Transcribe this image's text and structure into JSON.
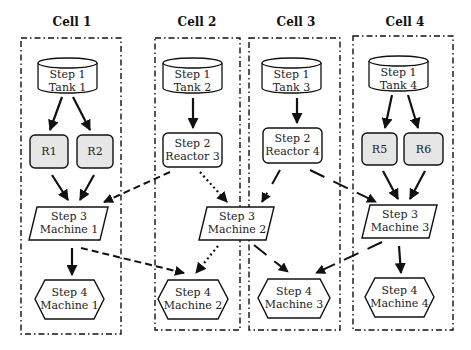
{
  "diagram": {
    "type": "manufacturing cell flow diagram",
    "cells": [
      {
        "id": "cell1",
        "label": "Cell 1"
      },
      {
        "id": "cell2",
        "label": "Cell 2"
      },
      {
        "id": "cell3",
        "label": "Cell 3"
      },
      {
        "id": "cell4",
        "label": "Cell 4"
      }
    ],
    "nodes": {
      "tank1": {
        "line1": "Step 1",
        "line2": "Tank 1",
        "shape": "cylinder"
      },
      "tank2": {
        "line1": "Step 1",
        "line2": "Tank 2",
        "shape": "cylinder"
      },
      "tank3": {
        "line1": "Step 1",
        "line2": "Tank 3",
        "shape": "cylinder"
      },
      "tank4": {
        "line1": "Step 1",
        "line2": "Tank 4",
        "shape": "cylinder"
      },
      "r1": {
        "label": "R1",
        "shape": "rounded-rect-shaded"
      },
      "r2": {
        "label": "R2",
        "shape": "rounded-rect-shaded"
      },
      "r5": {
        "label": "R5",
        "shape": "rounded-rect-shaded"
      },
      "r6": {
        "label": "R6",
        "shape": "rounded-rect-shaded"
      },
      "reactor3": {
        "line1": "Step 2",
        "line2": "Reactor 3",
        "shape": "rounded-rect"
      },
      "reactor4": {
        "line1": "Step 2",
        "line2": "Reactor 4",
        "shape": "rounded-rect"
      },
      "s3m1": {
        "line1": "Step 3",
        "line2": "Machine 1",
        "shape": "parallelogram"
      },
      "s3m2": {
        "line1": "Step 3",
        "line2": "Machine 2",
        "shape": "parallelogram"
      },
      "s3m3": {
        "line1": "Step 3",
        "line2": "Machine 3",
        "shape": "parallelogram"
      },
      "s4m1": {
        "line1": "Step 4",
        "line2": "Machine 1",
        "shape": "hexagon"
      },
      "s4m2": {
        "line1": "Step 4",
        "line2": "Machine 2",
        "shape": "hexagon"
      },
      "s4m3": {
        "line1": "Step 4",
        "line2": "Machine 3",
        "shape": "hexagon"
      },
      "s4m4": {
        "line1": "Step 4",
        "line2": "Machine 4",
        "shape": "hexagon"
      }
    },
    "edges": [
      {
        "from": "tank1",
        "to": "r1",
        "style": "solid"
      },
      {
        "from": "tank1",
        "to": "r2",
        "style": "solid"
      },
      {
        "from": "r1",
        "to": "s3m1",
        "style": "solid"
      },
      {
        "from": "r2",
        "to": "s3m1",
        "style": "solid"
      },
      {
        "from": "s3m1",
        "to": "s4m1",
        "style": "solid"
      },
      {
        "from": "s3m1",
        "to": "s4m2",
        "style": "dashed"
      },
      {
        "from": "tank2",
        "to": "reactor3",
        "style": "solid"
      },
      {
        "from": "reactor3",
        "to": "s3m1",
        "style": "dashed"
      },
      {
        "from": "reactor3",
        "to": "s3m2",
        "style": "dotted"
      },
      {
        "from": "s3m2",
        "to": "s4m2",
        "style": "dotted"
      },
      {
        "from": "s3m2",
        "to": "s4m3",
        "style": "solid-segmented"
      },
      {
        "from": "tank3",
        "to": "reactor4",
        "style": "solid"
      },
      {
        "from": "reactor4",
        "to": "s3m2",
        "style": "solid-segmented"
      },
      {
        "from": "reactor4",
        "to": "s3m3",
        "style": "solid-segmented"
      },
      {
        "from": "tank4",
        "to": "r5",
        "style": "solid"
      },
      {
        "from": "tank4",
        "to": "r6",
        "style": "solid"
      },
      {
        "from": "r5",
        "to": "s3m3",
        "style": "solid"
      },
      {
        "from": "r6",
        "to": "s3m3",
        "style": "solid"
      },
      {
        "from": "s3m3",
        "to": "s4m4",
        "style": "solid"
      },
      {
        "from": "s3m3",
        "to": "s4m3",
        "style": "solid-segmented"
      }
    ],
    "colors": {
      "stroke": "#111111",
      "shaded_fill": "#e6e6e6",
      "background": "#ffffff"
    }
  }
}
